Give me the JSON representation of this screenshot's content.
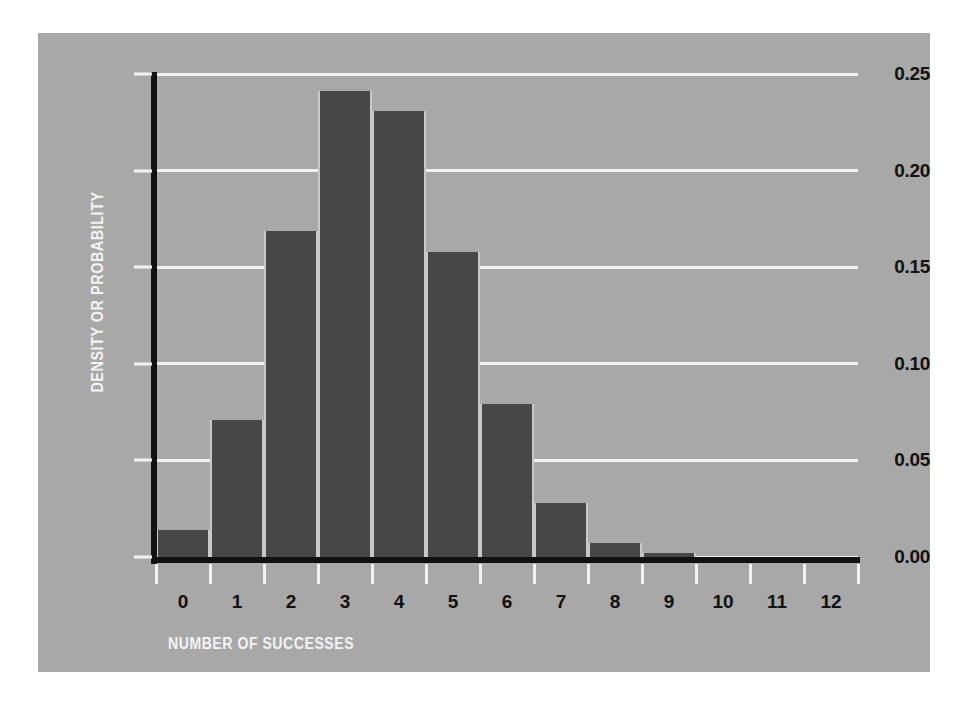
{
  "figure": {
    "page_background": "#ffffff",
    "panel_background": "#a8a8a8",
    "bar_color": "#474747",
    "axis_color": "#121212",
    "gridline_color": "#f2f2f2",
    "label_color": "#111111",
    "title_color": "#f4f4f4"
  },
  "chart_data": {
    "type": "bar",
    "title": "",
    "xlabel": "NUMBER OF SUCCESSES",
    "ylabel": "DENSITY OR PROBABILITY",
    "categories": [
      "0",
      "1",
      "2",
      "3",
      "4",
      "5",
      "6",
      "7",
      "8",
      "9",
      "10",
      "11",
      "12"
    ],
    "values": [
      0.014,
      0.071,
      0.169,
      0.241,
      0.231,
      0.158,
      0.079,
      0.028,
      0.007,
      0.002,
      0.0,
      0.0,
      0.0
    ],
    "xlim": [
      0,
      13
    ],
    "ylim": [
      0.0,
      0.25
    ],
    "ytick_labels": [
      "0.25",
      "0.20",
      "0.15",
      "0.10",
      "0.05",
      "0.00"
    ],
    "ytick_values": [
      0.25,
      0.2,
      0.15,
      0.1,
      0.05,
      0.0
    ],
    "xtick_labels": [
      "0",
      "1",
      "2",
      "3",
      "4",
      "5",
      "6",
      "7",
      "8",
      "9",
      "10",
      "11",
      "12"
    ],
    "grid": true,
    "legend": null,
    "legend_position": "none",
    "annotations": []
  }
}
